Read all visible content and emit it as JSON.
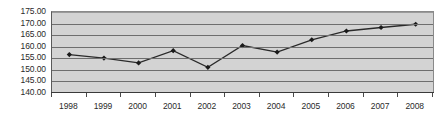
{
  "chart_data": {
    "type": "line",
    "title": "",
    "xlabel": "",
    "ylabel": "",
    "categories": [
      "1998",
      "1999",
      "2000",
      "2001",
      "2002",
      "2003",
      "2004",
      "2005",
      "2006",
      "2007",
      "2008"
    ],
    "values": [
      156.6,
      155.1,
      153.0,
      158.3,
      151.1,
      160.5,
      157.7,
      163.0,
      166.8,
      168.3,
      169.7
    ],
    "series": [
      {
        "name": "",
        "values": [
          156.6,
          155.1,
          153.0,
          158.3,
          151.1,
          160.5,
          157.7,
          163.0,
          166.8,
          168.3,
          169.7
        ]
      }
    ],
    "ylim": [
      140.0,
      175.0
    ],
    "y_ticks": [
      "140.00",
      "145.00",
      "150.00",
      "155.00",
      "160.00",
      "165.00",
      "170.00",
      "175.00"
    ],
    "y_tick_values": [
      140,
      145,
      150,
      155,
      160,
      165,
      170,
      175
    ],
    "grid": true,
    "legend": "none",
    "marker": "diamond",
    "colors": {
      "plot_background": "#d3d3d3",
      "gridline": "#6e6e6e",
      "line": "#2a2a2a",
      "marker": "#1a1a1a",
      "axis": "#3a3a3a",
      "text": "#2b2b2b",
      "page_background": "#ffffff"
    }
  }
}
